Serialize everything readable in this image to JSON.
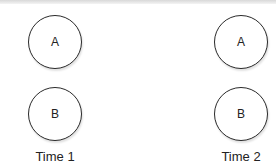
{
  "diagram": {
    "columns": [
      {
        "label": "Time 1",
        "nodes": [
          {
            "id": "A",
            "label": "A"
          },
          {
            "id": "B",
            "label": "B"
          }
        ]
      },
      {
        "label": "Time 2",
        "nodes": [
          {
            "id": "A",
            "label": "A"
          },
          {
            "id": "B",
            "label": "B"
          }
        ]
      }
    ],
    "colors": {
      "stroke": "#2a2a2a",
      "fill": "#ffffff",
      "text": "#222222"
    }
  }
}
